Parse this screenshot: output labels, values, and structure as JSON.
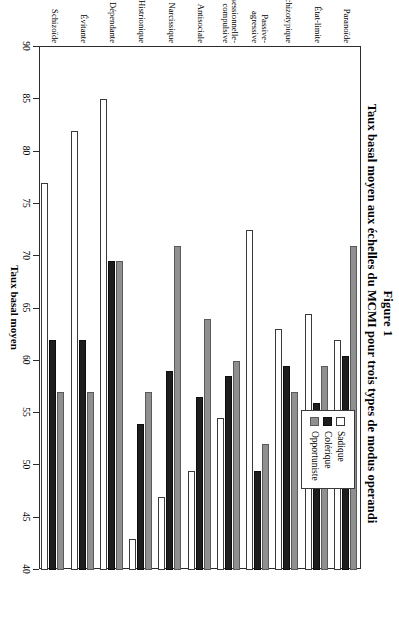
{
  "figure": {
    "number": "Figure 1",
    "title": "Taux basal moyen aux échelles du MCMI pour trois types de modus operandi"
  },
  "legend": {
    "position": "top-left-inside",
    "entries": [
      {
        "label": "Sadique",
        "color": "#ffffff"
      },
      {
        "label": "Colérique",
        "color": "#1d1d1d"
      },
      {
        "label": "Opportuniste",
        "color": "#8f8f8f"
      }
    ]
  },
  "chart_data": {
    "type": "bar",
    "orientation": "horizontal",
    "title": "Taux basal moyen aux échelles du MCMI pour trois types de modus operandi",
    "xlabel": "Taux basal moyen",
    "ylabel": "",
    "xlim": [
      40,
      90
    ],
    "xticks": [
      40,
      45,
      50,
      55,
      60,
      65,
      70,
      75,
      80,
      85,
      90
    ],
    "grid": false,
    "legend_position": "inside-upper-left",
    "categories": [
      "Schizoïde",
      "Évitante",
      "Dépendante",
      "Histrionique",
      "Narcissique",
      "Antisociale",
      "Obsessionnelle-compulsive",
      "Passive-agressive",
      "Schizotypique",
      "État-limite",
      "Paranoïde"
    ],
    "series": [
      {
        "name": "Sadique",
        "color": "#ffffff",
        "values": [
          77.0,
          82.0,
          85.0,
          43.0,
          47.0,
          49.5,
          54.5,
          72.5,
          63.0,
          64.5,
          62.0
        ]
      },
      {
        "name": "Colérique",
        "color": "#1d1d1d",
        "values": [
          62.0,
          62.0,
          69.5,
          54.0,
          59.0,
          56.5,
          58.5,
          49.5,
          59.5,
          56.0,
          60.5
        ]
      },
      {
        "name": "Opportuniste",
        "color": "#8f8f8f",
        "values": [
          57.0,
          57.0,
          69.5,
          57.0,
          71.0,
          64.0,
          60.0,
          52.0,
          57.0,
          59.5,
          71.0
        ]
      }
    ]
  }
}
